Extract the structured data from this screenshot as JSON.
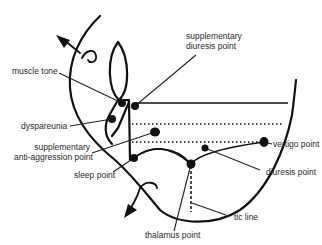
{
  "diagram": {
    "type": "auricular acupuncture point chart (ear diagram)",
    "colors": {
      "ink": "#111111",
      "text": "#2a2a2a",
      "background": "#ffffff"
    },
    "labels": {
      "supplementary_diuresis_point_line1": "supplementary",
      "supplementary_diuresis_point_line2": "diuresis point",
      "muscle_tone": "muscle tone",
      "dyspareunia": "dyspareunia",
      "supplementary_anti_aggression_line1": "supplementary",
      "supplementary_anti_aggression_line2": "anti-aggression point",
      "sleep_point": "sleep point",
      "vertigo_point": "vertigo point",
      "diuresis_point": "diuresis point",
      "tic_line": "tic line",
      "thalamus_point": "thalamus point"
    },
    "points": [
      {
        "name": "muscle tone",
        "x": 122,
        "y": 103
      },
      {
        "name": "supplementary diuresis point",
        "x": 135,
        "y": 106
      },
      {
        "name": "dyspareunia",
        "x": 112,
        "y": 119
      },
      {
        "name": "supplementary anti-aggression point",
        "x": 155,
        "y": 132
      },
      {
        "name": "sleep point",
        "x": 134,
        "y": 158
      },
      {
        "name": "diuresis point",
        "x": 205,
        "y": 148
      },
      {
        "name": "vertigo point",
        "x": 264,
        "y": 142
      },
      {
        "name": "thalamus point",
        "x": 191,
        "y": 164
      }
    ]
  }
}
